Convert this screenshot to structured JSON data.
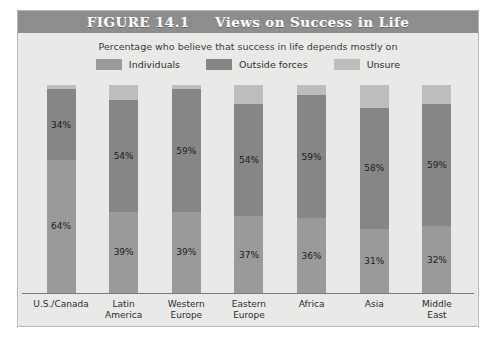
{
  "figure": {
    "title": "FIGURE 14.1     Views on Success in Life",
    "subtitle": "Percentage who believe that success in life depends mostly on"
  },
  "colors": {
    "panel_background": "#e9e9e7",
    "title_bar": "#8d8d8d",
    "title_text": "#ffffff",
    "individuals": "#9a9a9a",
    "outside_forces": "#868686",
    "unsure": "#bdbdbd",
    "axis": "#7a7a7a"
  },
  "legend": {
    "items": [
      {
        "label": "Individuals",
        "color": "#9a9a9a",
        "key": "individuals"
      },
      {
        "label": "Outside forces",
        "color": "#868686",
        "key": "outside_forces"
      },
      {
        "label": "Unsure",
        "color": "#bdbdbd",
        "key": "unsure"
      }
    ]
  },
  "chart_data": {
    "type": "bar",
    "subtype": "stacked-column",
    "title": "FIGURE 14.1     Views on Success in Life",
    "subtitle": "Percentage who believe that success in life depends mostly on",
    "xlabel": "",
    "ylabel": "",
    "ylim": [
      0,
      100
    ],
    "grid": false,
    "legend_position": "top-center",
    "categories": [
      "U.S./Canada",
      "Latin America",
      "Western Europe",
      "Eastern Europe",
      "Africa",
      "Asia",
      "Middle East"
    ],
    "category_lines": [
      [
        "U.S./Canada"
      ],
      [
        "Latin",
        "America"
      ],
      [
        "Western",
        "Europe"
      ],
      [
        "Eastern",
        "Europe"
      ],
      [
        "Africa"
      ],
      [
        "Asia"
      ],
      [
        "Middle",
        "East"
      ]
    ],
    "series": [
      {
        "name": "Individuals",
        "color": "#9a9a9a",
        "values": [
          64,
          39,
          39,
          37,
          36,
          31,
          32
        ],
        "labels": [
          "64%",
          "39%",
          "39%",
          "37%",
          "36%",
          "31%",
          "32%"
        ]
      },
      {
        "name": "Outside forces",
        "color": "#868686",
        "values": [
          34,
          54,
          59,
          54,
          59,
          58,
          59
        ],
        "labels": [
          "34%",
          "54%",
          "59%",
          "54%",
          "59%",
          "58%",
          "59%"
        ]
      },
      {
        "name": "Unsure",
        "color": "#bdbdbd",
        "values": [
          2,
          7,
          2,
          9,
          5,
          11,
          9
        ],
        "labels": [
          "",
          "",
          "",
          "",
          "",
          "",
          ""
        ]
      }
    ]
  }
}
